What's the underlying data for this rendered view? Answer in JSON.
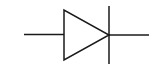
{
  "diagram": {
    "type": "circuit-symbol",
    "symbol": "diode",
    "stroke_color": "#1a1a1a",
    "background": "#ffffff",
    "components": [
      {
        "name": "anode-lead",
        "from": [
          24,
          34
        ],
        "to": [
          64,
          34
        ]
      },
      {
        "name": "triangle",
        "points": [
          [
            64,
            10
          ],
          [
            64,
            60
          ],
          [
            109,
            35
          ]
        ]
      },
      {
        "name": "cathode-bar",
        "from": [
          109,
          6
        ],
        "to": [
          109,
          64
        ]
      },
      {
        "name": "cathode-lead",
        "from": [
          109,
          35
        ],
        "to": [
          149,
          35
        ]
      }
    ]
  }
}
